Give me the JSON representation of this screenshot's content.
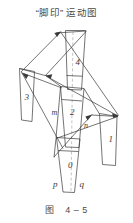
{
  "figure": {
    "title": "“脚印” 运动图",
    "caption_label": "图",
    "caption_number": "4 – 5",
    "background_color": "#ffffff",
    "stroke_color": "#3a3a3a",
    "dash_color": "#8a8a8a"
  },
  "labels": {
    "step0": "0",
    "step1": "1",
    "step2": "2",
    "step3": "3",
    "step4": "4",
    "m": "m",
    "n": "n",
    "p": "p",
    "q": "q"
  },
  "diagram_data": {
    "type": "diagram",
    "description": "Footprint (shoe sole) motion diagram: five trapezoidal footprint outlines connected by straight motion-path arrows, with a vertical dashed centre axis.",
    "footprints": [
      {
        "id": "0",
        "label": "0",
        "position": "bottom-centre"
      },
      {
        "id": "1",
        "label": "1",
        "position": "right"
      },
      {
        "id": "2",
        "label": "2",
        "position": "centre"
      },
      {
        "id": "3",
        "label": "3",
        "position": "left"
      },
      {
        "id": "4",
        "label": "4",
        "position": "top-centre"
      }
    ],
    "point_labels": [
      "m",
      "n",
      "p",
      "q"
    ],
    "centre_axis": "vertical dashed line"
  }
}
